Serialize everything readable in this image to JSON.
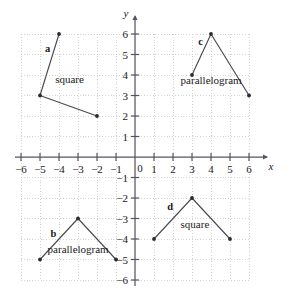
{
  "chart_data": {
    "type": "scatter",
    "title": "",
    "xlabel": "x",
    "ylabel": "y",
    "xlim": [
      -6,
      6
    ],
    "ylim": [
      -6,
      6
    ],
    "grid": true,
    "grid_style": "dotted",
    "legend": "none",
    "x_ticks": [
      "-6",
      "-5",
      "-4",
      "-3",
      "-2",
      "-1",
      "0",
      "1",
      "2",
      "3",
      "4",
      "5",
      "6"
    ],
    "y_ticks": [
      "6",
      "5",
      "4",
      "3",
      "2",
      "1",
      "-1",
      "-2",
      "-3",
      "-4",
      "-5",
      "-6"
    ],
    "origin_label": "0",
    "series": [
      {
        "name": "a",
        "label": "square",
        "letter": "a",
        "points": [
          [
            -4,
            6
          ],
          [
            -5,
            3
          ],
          [
            -2,
            2
          ]
        ],
        "letter_pos": [
          -4.6,
          5.1
        ],
        "label_pos": [
          -4.2,
          3.6
        ]
      },
      {
        "name": "b",
        "label": "parallelogram",
        "letter": "b",
        "points": [
          [
            -5,
            -5
          ],
          [
            -3,
            -3
          ],
          [
            -1,
            -5
          ]
        ],
        "letter_pos": [
          -4.3,
          -3.9
        ],
        "label_pos": [
          -4.6,
          -4.7
        ]
      },
      {
        "name": "c",
        "label": "parallelogram",
        "letter": "c",
        "points": [
          [
            3,
            4
          ],
          [
            4,
            6
          ],
          [
            6,
            3
          ]
        ],
        "letter_pos": [
          3.45,
          5.45
        ],
        "label_pos": [
          2.4,
          3.55
        ]
      },
      {
        "name": "d",
        "label": "square",
        "letter": "d",
        "points": [
          [
            1,
            -4
          ],
          [
            3,
            -2
          ],
          [
            5,
            -4
          ]
        ],
        "letter_pos": [
          1.85,
          -2.6
        ],
        "label_pos": [
          2.4,
          -3.45
        ]
      }
    ]
  },
  "colors": {
    "line": "#4a4a52",
    "vertex": "#2b2b2b",
    "axis": "#555560",
    "grid": "#c8c8cc",
    "text": "#1a1a1a",
    "background": "#ffffff"
  },
  "axes": {
    "x_axis_name": "x",
    "y_axis_name": "y"
  }
}
